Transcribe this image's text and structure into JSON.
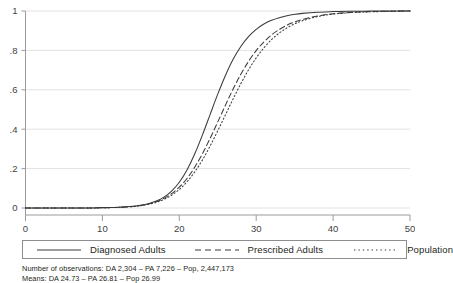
{
  "chart_data": {
    "type": "line",
    "title": "",
    "subtitle": "",
    "xlabel": "",
    "ylabel": "",
    "xlim": [
      0,
      50
    ],
    "ylim": [
      0,
      1
    ],
    "grid": "horizontal",
    "legend_position": "below-plot",
    "x_ticks": [
      "0",
      "10",
      "20",
      "30",
      "40",
      "50"
    ],
    "x_tick_values": [
      0,
      10,
      20,
      30,
      40,
      50
    ],
    "y_ticks": [
      "0",
      ".2",
      ".4",
      ".6",
      ".8",
      "1"
    ],
    "y_tick_values": [
      0,
      0.2,
      0.4,
      0.6,
      0.8,
      1
    ],
    "series": [
      {
        "name": "Diagnosed Adults",
        "style": "solid",
        "color": "#3a3a3a",
        "mean": 24.73,
        "n": 2304,
        "x": [
          0,
          2,
          4,
          6,
          8,
          10,
          12,
          14,
          15,
          16,
          17,
          18,
          19,
          20,
          21,
          22,
          23,
          24,
          25,
          26,
          27,
          28,
          29,
          30,
          31,
          32,
          33,
          34,
          35,
          36,
          38,
          40,
          42,
          44,
          46,
          48,
          50
        ],
        "y": [
          0,
          0,
          0,
          0,
          0,
          0.002,
          0.004,
          0.009,
          0.014,
          0.022,
          0.035,
          0.055,
          0.086,
          0.131,
          0.193,
          0.274,
          0.37,
          0.474,
          0.578,
          0.673,
          0.755,
          0.82,
          0.87,
          0.907,
          0.934,
          0.953,
          0.966,
          0.976,
          0.983,
          0.988,
          0.994,
          0.997,
          0.999,
          0.999,
          1,
          1,
          1
        ]
      },
      {
        "name": "Prescribed Adults",
        "style": "dashed",
        "color": "#3a3a3a",
        "mean": 26.81,
        "n": 7226,
        "x": [
          0,
          2,
          4,
          6,
          8,
          10,
          12,
          14,
          15,
          16,
          17,
          18,
          19,
          20,
          21,
          22,
          23,
          24,
          25,
          26,
          27,
          28,
          29,
          30,
          31,
          32,
          33,
          34,
          35,
          36,
          38,
          40,
          42,
          44,
          46,
          48,
          50
        ],
        "y": [
          0,
          0,
          0,
          0,
          0,
          0.001,
          0.003,
          0.008,
          0.013,
          0.021,
          0.032,
          0.049,
          0.073,
          0.106,
          0.15,
          0.207,
          0.275,
          0.353,
          0.437,
          0.522,
          0.604,
          0.679,
          0.744,
          0.799,
          0.843,
          0.879,
          0.906,
          0.928,
          0.944,
          0.957,
          0.975,
          0.986,
          0.992,
          0.996,
          0.998,
          0.999,
          1
        ]
      },
      {
        "name": "Population",
        "style": "dotted",
        "color": "#3a3a3a",
        "mean": 26.99,
        "n": 2447173,
        "x": [
          0,
          2,
          4,
          6,
          8,
          10,
          12,
          14,
          15,
          16,
          17,
          18,
          19,
          20,
          21,
          22,
          23,
          24,
          25,
          26,
          27,
          28,
          29,
          30,
          31,
          32,
          33,
          34,
          35,
          36,
          38,
          40,
          42,
          44,
          46,
          48,
          50
        ],
        "y": [
          0,
          0,
          0,
          0,
          0,
          0.001,
          0.003,
          0.007,
          0.012,
          0.019,
          0.029,
          0.044,
          0.065,
          0.094,
          0.133,
          0.183,
          0.243,
          0.314,
          0.392,
          0.473,
          0.554,
          0.631,
          0.701,
          0.762,
          0.813,
          0.855,
          0.888,
          0.914,
          0.935,
          0.95,
          0.972,
          0.984,
          0.991,
          0.995,
          0.997,
          0.999,
          1
        ]
      }
    ]
  },
  "legend": {
    "items": [
      {
        "label": "Diagnosed Adults",
        "style": "solid"
      },
      {
        "label": "Prescribed Adults",
        "style": "dashed"
      },
      {
        "label": "Population",
        "style": "dotted"
      }
    ]
  },
  "footnotes": {
    "line1": "Number of observations: DA 2,304 – PA 7,226 – Pop, 2,447,173",
    "line2": "Means: DA 24.73 – PA 26.81 – Pop 26.99"
  },
  "colors": {
    "line": "#3a3a3a",
    "grid": "#e2e2e2",
    "axis": "#9b9b9b",
    "text": "#231f20",
    "tick_text": "#3f3f3f",
    "legend_border": "#8d8d8d",
    "background": "#ffffff"
  }
}
